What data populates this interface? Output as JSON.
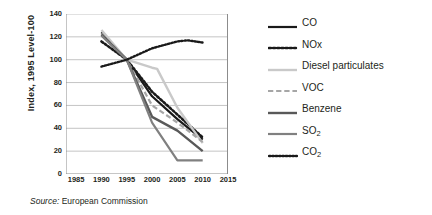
{
  "chart_data": {
    "type": "line",
    "title": "",
    "xlabel": "",
    "ylabel": "Index, 1995 Level-100",
    "xlim": [
      1983,
      2015
    ],
    "ylim": [
      0,
      140
    ],
    "xticks": [
      1985,
      1990,
      1995,
      2000,
      2005,
      2010,
      2015
    ],
    "yticks": [
      0,
      20,
      40,
      60,
      80,
      100,
      120,
      140
    ],
    "grid": "horizontal",
    "legend_position": "right",
    "series": [
      {
        "name": "CO",
        "color": "#1a1a1a",
        "style": "solid",
        "width": 2.2,
        "x": [
          1990,
          1995,
          2000,
          2005,
          2010
        ],
        "values": [
          124,
          100,
          68,
          48,
          30
        ]
      },
      {
        "name": "NOx",
        "color": "#1a1a1a",
        "style": "dotted",
        "width": 2.6,
        "x": [
          1990,
          1995,
          2000,
          2005,
          2010
        ],
        "values": [
          116,
          100,
          72,
          52,
          32
        ]
      },
      {
        "name": "Diesel particulates",
        "color": "#c9c9c9",
        "style": "solid",
        "width": 2.4,
        "x": [
          1990,
          1995,
          2000,
          2001,
          2005,
          2010
        ],
        "values": [
          126,
          100,
          93,
          92,
          58,
          27
        ]
      },
      {
        "name": "VOC",
        "color": "#a6a6a6",
        "style": "dashed",
        "width": 2.2,
        "x": [
          1990,
          1995,
          2000,
          2005,
          2010
        ],
        "values": [
          123,
          100,
          60,
          45,
          28
        ]
      },
      {
        "name": "Benzene",
        "color": "#595959",
        "style": "solid",
        "width": 2.4,
        "x": [
          1990,
          1995,
          2000,
          2005,
          2010
        ],
        "values": [
          122,
          100,
          50,
          38,
          20
        ]
      },
      {
        "name": "SO2",
        "color": "#808080",
        "style": "solid",
        "width": 2.2,
        "x": [
          1990,
          1995,
          2000,
          2005,
          2010
        ],
        "values": [
          121,
          100,
          45,
          12,
          12
        ]
      },
      {
        "name": "CO2",
        "color": "#1a1a1a",
        "style": "fine-dotted",
        "width": 2.4,
        "x": [
          1990,
          1995,
          2000,
          2005,
          2007,
          2010
        ],
        "values": [
          94,
          100,
          110,
          116,
          117,
          115
        ]
      }
    ]
  },
  "legend": {
    "items": [
      {
        "label": "CO",
        "sub": ""
      },
      {
        "label": "NOx",
        "sub": ""
      },
      {
        "label": "Diesel particulates",
        "sub": ""
      },
      {
        "label": "VOC",
        "sub": ""
      },
      {
        "label": "Benzene",
        "sub": ""
      },
      {
        "label": "SO",
        "sub": "2"
      },
      {
        "label": "CO",
        "sub": "2"
      }
    ]
  },
  "source": {
    "label": "Source:",
    "text": "European Commission"
  }
}
